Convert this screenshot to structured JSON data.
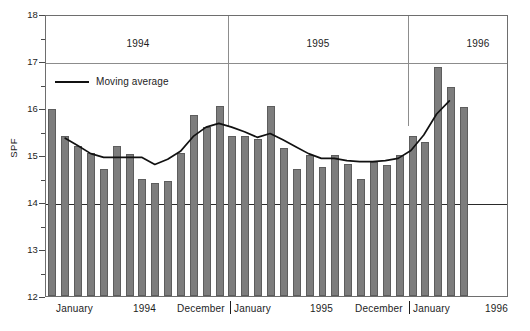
{
  "chart_data": {
    "type": "bar",
    "title": "",
    "subtitle": "",
    "xlabel": "",
    "ylabel": "SPF",
    "ylim": [
      12,
      18
    ],
    "yticks": [
      12,
      13,
      14,
      15,
      16,
      17,
      18
    ],
    "yminor": [
      12.5,
      13.5,
      14.5,
      15.5,
      16.5,
      17.5
    ],
    "grid": "horizontal gridlines at 14 and 17; plot border box",
    "legend": {
      "position": "inside top-left",
      "entries": [
        "Moving average"
      ]
    },
    "x_group_labels": [
      "1994",
      "1995",
      "1996"
    ],
    "x_tick_labels": [
      "January",
      "1994",
      "December",
      "January",
      "1995",
      "December",
      "January",
      "1996"
    ],
    "categories": [
      "1994-01",
      "1994-02",
      "1994-03",
      "1994-04",
      "1994-05",
      "1994-06",
      "1994-07",
      "1994-08",
      "1994-09",
      "1994-10",
      "1994-11",
      "1994-12",
      "1995-01",
      "1995-02",
      "1995-03",
      "1995-04",
      "1995-05",
      "1995-06",
      "1995-07",
      "1995-08",
      "1995-09",
      "1995-10",
      "1995-11",
      "1995-12",
      "1996-01",
      "1996-02",
      "1996-03",
      "1996-04",
      "1996-05",
      "1996-06",
      "1996-07",
      "1996-08",
      "1996-09",
      "1996-10",
      "1996-11",
      "1996-12"
    ],
    "series": [
      {
        "name": "SPF",
        "type": "bar",
        "values": [
          15.98,
          15.4,
          15.2,
          15.05,
          14.7,
          15.2,
          15.03,
          14.5,
          14.4,
          14.45,
          15.05,
          15.85,
          15.6,
          16.05,
          15.4,
          15.4,
          15.35,
          16.05,
          15.15,
          14.7,
          15.0,
          14.75,
          15.0,
          14.8,
          14.5,
          14.85,
          14.78,
          15.0,
          15.4,
          15.28,
          16.88,
          16.45,
          16.03,
          0,
          0,
          0
        ]
      },
      {
        "name": "Moving average",
        "type": "line",
        "values": [
          null,
          15.38,
          15.22,
          15.05,
          14.97,
          14.97,
          14.97,
          14.97,
          14.82,
          14.93,
          15.1,
          15.42,
          15.62,
          15.7,
          15.62,
          15.52,
          15.4,
          15.48,
          15.35,
          15.2,
          15.05,
          14.95,
          14.95,
          14.9,
          14.88,
          14.88,
          14.9,
          14.95,
          15.12,
          15.45,
          15.9,
          16.18,
          null,
          null,
          null,
          null
        ]
      }
    ],
    "colors": {
      "bar_fill": "#7d7d7d",
      "bar_stroke": "#5d5d5d",
      "line": "#111111",
      "grid": "#8c8c8c",
      "axis": "#6e6e6e",
      "text": "#1d1d1d",
      "background": "#ffffff"
    },
    "annotations": [
      {
        "kind": "year-divider",
        "after_category": "1994-12"
      },
      {
        "kind": "year-divider",
        "after_category": "1995-12"
      }
    ]
  },
  "axis": {
    "y_title": "SPF",
    "y_tick_labels": [
      "12",
      "13",
      "14",
      "15",
      "16",
      "17",
      "18"
    ]
  },
  "legend": {
    "moving_average_label": "Moving average"
  },
  "bands": {
    "year1": "1994",
    "year2": "1995",
    "year3": "1996"
  },
  "xaxis": {
    "t1": "January",
    "t2": "1994",
    "t3": "December",
    "t4": "January",
    "t5": "1995",
    "t6": "December",
    "t7": "January",
    "t8": "1996"
  }
}
